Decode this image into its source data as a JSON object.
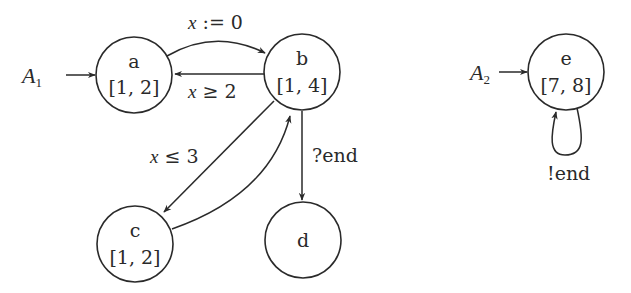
{
  "diagram": {
    "type": "timed-automata",
    "automata": [
      {
        "name": "A",
        "subscript": "1",
        "initial_node": "a",
        "nodes": [
          {
            "id": "a",
            "label": "a",
            "interval": "[1, 2]"
          },
          {
            "id": "b",
            "label": "b",
            "interval": "[1, 4]"
          },
          {
            "id": "c",
            "label": "c",
            "interval": "[1, 2]"
          },
          {
            "id": "d",
            "label": "d",
            "interval": ""
          }
        ],
        "edges": [
          {
            "from": "a",
            "to": "b",
            "label": "x := 0"
          },
          {
            "from": "b",
            "to": "a",
            "label": "x ≥ 2"
          },
          {
            "from": "b",
            "to": "c",
            "label": "x ≤ 3"
          },
          {
            "from": "c",
            "to": "b",
            "label": ""
          },
          {
            "from": "b",
            "to": "d",
            "label": "?end"
          }
        ]
      },
      {
        "name": "A",
        "subscript": "2",
        "initial_node": "e",
        "nodes": [
          {
            "id": "e",
            "label": "e",
            "interval": "[7, 8]"
          }
        ],
        "edges": [
          {
            "from": "e",
            "to": "e",
            "label": "!end"
          }
        ]
      }
    ]
  },
  "labels": {
    "a1_name": "A",
    "a1_sub": "1",
    "a2_name": "A",
    "a2_sub": "2",
    "node_a": "a",
    "node_a_interval": "[1, 2]",
    "node_b": "b",
    "node_b_interval": "[1, 4]",
    "node_c": "c",
    "node_c_interval": "[1, 2]",
    "node_d": "d",
    "node_e": "e",
    "node_e_interval": "[7, 8]",
    "edge_ab_var": "x",
    "edge_ab_rest": " := 0",
    "edge_ba_var": "x",
    "edge_ba_rest": " ≥ 2",
    "edge_bc_var": "x",
    "edge_bc_rest": " ≤ 3",
    "edge_bd": "?end",
    "edge_ee": "!end"
  },
  "colors": {
    "stroke": "#2a2a2a",
    "background": "#ffffff"
  }
}
